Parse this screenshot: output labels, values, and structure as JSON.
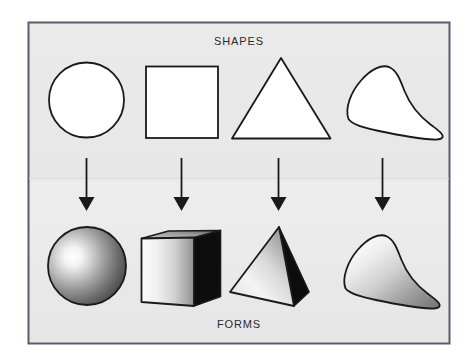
{
  "diagram": {
    "title_top": "SHAPES",
    "title_bottom": "FORMS",
    "panel": {
      "background_color": "#e8e8e8",
      "border_color": "#5a5a70",
      "page_background": "#ffffff"
    },
    "ink_color": "#1a1a1a",
    "rows": [
      {
        "name": "shapes-row",
        "label": "SHAPES",
        "description": "two-dimensional outlined shapes",
        "items": [
          {
            "name": "circle",
            "label": "circle",
            "fill": "#ffffff",
            "stroke": "#1a1a1a"
          },
          {
            "name": "square",
            "label": "square",
            "fill": "#ffffff",
            "stroke": "#1a1a1a"
          },
          {
            "name": "triangle",
            "label": "triangle",
            "fill": "#ffffff",
            "stroke": "#1a1a1a"
          },
          {
            "name": "free-form-shape",
            "label": "free-form shape",
            "fill": "#ffffff",
            "stroke": "#1a1a1a"
          }
        ]
      },
      {
        "name": "forms-row",
        "label": "FORMS",
        "description": "three-dimensional shaded forms",
        "items": [
          {
            "name": "sphere",
            "label": "sphere",
            "highlight": "#ffffff",
            "shade": "#4a4a4a",
            "stroke": "#1a1a1a"
          },
          {
            "name": "cube",
            "label": "cube",
            "highlight": "#f2f2f2",
            "shade": "#8d8d8d",
            "side": "#0d0d0d",
            "stroke": "#1a1a1a"
          },
          {
            "name": "pyramid",
            "label": "pyramid",
            "highlight": "#f2f2f2",
            "shade": "#9a9a9a",
            "side": "#0d0d0d",
            "stroke": "#1a1a1a"
          },
          {
            "name": "free-form-volume",
            "label": "free-form volume",
            "highlight": "#f7f7f7",
            "shade": "#808080",
            "stroke": "#1a1a1a"
          }
        ]
      }
    ],
    "arrows": [
      {
        "name": "arrow-circle-to-sphere",
        "direction": "down"
      },
      {
        "name": "arrow-square-to-cube",
        "direction": "down"
      },
      {
        "name": "arrow-triangle-to-pyramid",
        "direction": "down"
      },
      {
        "name": "arrow-blob-to-volume",
        "direction": "down"
      }
    ]
  }
}
